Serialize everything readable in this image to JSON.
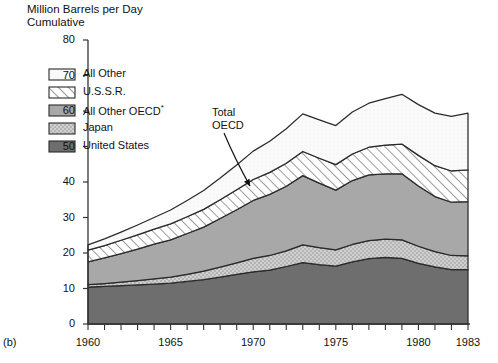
{
  "title": {
    "line1": "Million Barrels per Day",
    "line2": "Cumulative"
  },
  "panel_label": "(b)",
  "annotation": {
    "line1": "Total",
    "line2": "OECD"
  },
  "legend": {
    "items": [
      {
        "label": "All Other",
        "key": "all_other",
        "fill": "white",
        "color": "#ffffff"
      },
      {
        "label": "U.S.S.R.",
        "key": "ussr",
        "fill": "hatch",
        "color": "#ffffff"
      },
      {
        "label": "All Other OECD",
        "key": "other_oecd",
        "fill": "solid",
        "color": "#a8a8a8",
        "superscript": "*"
      },
      {
        "label": "Japan",
        "key": "japan",
        "fill": "stipple",
        "color": "#c9c9c9"
      },
      {
        "label": "United States",
        "key": "united_states",
        "fill": "solid",
        "color": "#6e6e6e"
      }
    ]
  },
  "chart_data": {
    "type": "area",
    "stacked": true,
    "xlabel": "",
    "ylabel": "Million Barrels per Day",
    "xlim": [
      1960,
      1983
    ],
    "ylim": [
      0,
      80
    ],
    "ytick_step": 10,
    "yticks": [
      0,
      10,
      20,
      30,
      40,
      50,
      60,
      70,
      80
    ],
    "xticks": [
      1960,
      1961,
      1962,
      1963,
      1964,
      1965,
      1966,
      1967,
      1968,
      1969,
      1970,
      1971,
      1972,
      1973,
      1974,
      1975,
      1976,
      1977,
      1978,
      1979,
      1980,
      1981,
      1982,
      1983
    ],
    "xtick_labels": [
      1960,
      1965,
      1970,
      1975,
      1980,
      1983
    ],
    "grid": false,
    "legend_position": "upper-left-inside",
    "x": [
      1960,
      1961,
      1962,
      1963,
      1964,
      1965,
      1966,
      1967,
      1968,
      1969,
      1970,
      1971,
      1972,
      1973,
      1974,
      1975,
      1976,
      1977,
      1978,
      1979,
      1980,
      1981,
      1982,
      1983
    ],
    "series": [
      {
        "name": "United States",
        "values": [
          10.4,
          10.6,
          10.8,
          11.0,
          11.2,
          11.5,
          12.0,
          12.5,
          13.2,
          14.0,
          14.7,
          15.2,
          16.2,
          17.3,
          16.7,
          16.3,
          17.5,
          18.4,
          18.8,
          18.5,
          17.1,
          16.1,
          15.3,
          15.3
        ]
      },
      {
        "name": "Japan",
        "values": [
          0.7,
          0.8,
          1.0,
          1.2,
          1.5,
          1.7,
          2.0,
          2.4,
          2.8,
          3.2,
          3.8,
          4.1,
          4.4,
          5.0,
          4.8,
          4.6,
          4.9,
          5.1,
          5.1,
          5.2,
          4.8,
          4.3,
          4.0,
          3.9
        ]
      },
      {
        "name": "All Other OECD",
        "values": [
          6.4,
          7.2,
          8.0,
          8.9,
          9.8,
          10.5,
          11.5,
          12.4,
          13.7,
          15.0,
          16.3,
          17.2,
          18.2,
          19.5,
          18.2,
          16.8,
          18.0,
          18.5,
          18.4,
          18.6,
          17.0,
          15.5,
          15.0,
          15.3
        ]
      },
      {
        "name": "U.S.S.R.",
        "values": [
          3.3,
          3.5,
          3.8,
          4.0,
          4.2,
          4.5,
          4.7,
          5.0,
          5.3,
          5.6,
          5.9,
          6.2,
          6.5,
          6.8,
          7.0,
          7.2,
          7.5,
          7.8,
          8.1,
          8.4,
          8.6,
          8.7,
          8.8,
          8.9
        ]
      },
      {
        "name": "All Other",
        "values": [
          1.5,
          1.9,
          2.3,
          2.8,
          3.3,
          3.9,
          4.6,
          5.3,
          6.1,
          7.0,
          8.0,
          8.8,
          9.7,
          10.6,
          10.8,
          11.0,
          11.8,
          12.4,
          13.1,
          14.0,
          14.3,
          14.8,
          15.4,
          16.0
        ]
      }
    ],
    "totals": [
      22.3,
      24.0,
      25.9,
      27.9,
      30.0,
      32.1,
      34.8,
      37.6,
      41.1,
      44.8,
      48.7,
      51.5,
      55.0,
      59.2,
      57.5,
      55.9,
      59.7,
      62.2,
      63.5,
      64.7,
      61.8,
      59.4,
      58.5,
      59.4
    ],
    "annotations": [
      {
        "text": "Total OECD",
        "points_to_series": "All Other OECD",
        "x": 1972
      }
    ],
    "footnote_marker": "*"
  }
}
